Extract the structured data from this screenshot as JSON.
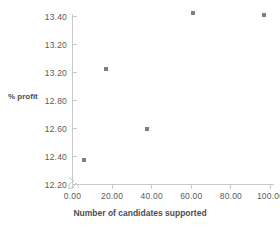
{
  "chart_data": {
    "type": "scatter",
    "title": "",
    "xlabel": "Number of candidates supported",
    "ylabel": "% profit",
    "xlim": [
      0,
      100
    ],
    "ylim": [
      12.2,
      13.4
    ],
    "grid": false,
    "legend": false,
    "marker_color": "#7f7f7f",
    "axis_color": "#c9c9c9",
    "axis_break": true,
    "x_ticks": [
      "0.00",
      "20.00",
      "40.00",
      "60.00",
      "80.00",
      "100.00"
    ],
    "x_tick_values": [
      0,
      20,
      40,
      60,
      80,
      100
    ],
    "y_ticks": [
      "13.40",
      "13.20",
      "13.20",
      "12.80",
      "12.60",
      "12.40",
      "12.20"
    ],
    "y_tick_values": [
      13.4,
      13.2,
      13.0,
      12.8,
      12.6,
      12.4,
      12.2
    ],
    "points": [
      {
        "x": 6,
        "y": 12.37
      },
      {
        "x": 17,
        "y": 13.02
      },
      {
        "x": 38,
        "y": 12.59
      },
      {
        "x": 61,
        "y": 13.42
      },
      {
        "x": 97,
        "y": 13.41
      }
    ]
  }
}
